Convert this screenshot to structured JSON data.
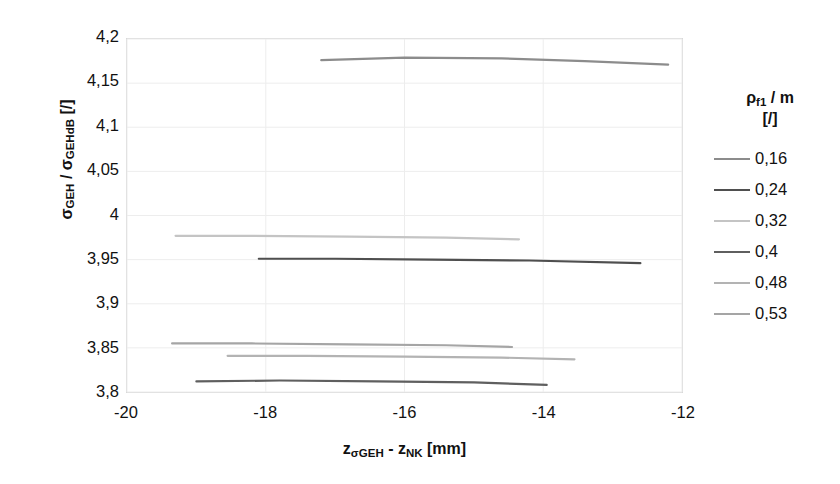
{
  "chart_data": {
    "type": "line",
    "title": "",
    "xlabel": "z_sigmaGEH - z_NK [mm]",
    "ylabel": "sigma_GEH / sigma_GEHdB [/]",
    "xlim": [
      -20,
      -12
    ],
    "ylim": [
      3.8,
      4.2
    ],
    "xticks": [
      "-20",
      "-18",
      "-16",
      "-14",
      "-12"
    ],
    "xtick_values": [
      -20,
      -18,
      -16,
      -14,
      -12
    ],
    "yticks": [
      "4,2",
      "4,15",
      "4,1",
      "4,05",
      "4",
      "3,95",
      "3,9",
      "3,85",
      "3,8"
    ],
    "ytick_values": [
      4.2,
      4.15,
      4.1,
      4.05,
      4.0,
      3.95,
      3.9,
      3.85,
      3.8
    ],
    "grid": true,
    "legend_position": "right",
    "legend_title_line1": "ρf1 / m",
    "legend_title_line2": "[/]",
    "series": [
      {
        "name": "0,16",
        "color": "#8c8c8c",
        "x": [
          -17.2,
          -16.0,
          -14.6,
          -13.4,
          -12.2
        ],
        "y": [
          4.176,
          4.179,
          4.178,
          4.175,
          4.171
        ]
      },
      {
        "name": "0,24",
        "color": "#4f4f4f",
        "x": [
          -18.1,
          -17.0,
          -15.6,
          -14.2,
          -12.6
        ],
        "y": [
          3.951,
          3.951,
          3.95,
          3.949,
          3.946
        ]
      },
      {
        "name": "0,32",
        "color": "#c4c4c4",
        "x": [
          -19.3,
          -18.2,
          -16.8,
          -15.4,
          -14.35
        ],
        "y": [
          3.977,
          3.977,
          3.976,
          3.975,
          3.973
        ]
      },
      {
        "name": "0,4",
        "color": "#5f5f5f",
        "x": [
          -19.0,
          -17.8,
          -16.4,
          -15.0,
          -13.95
        ],
        "y": [
          3.812,
          3.813,
          3.812,
          3.811,
          3.808
        ]
      },
      {
        "name": "0,48",
        "color": "#b3b3b3",
        "x": [
          -18.55,
          -17.4,
          -16.0,
          -14.6,
          -13.55
        ],
        "y": [
          3.841,
          3.841,
          3.84,
          3.839,
          3.837
        ]
      },
      {
        "name": "0,53",
        "color": "#a5a5a5",
        "x": [
          -19.35,
          -18.2,
          -16.8,
          -15.4,
          -14.45
        ],
        "y": [
          3.855,
          3.855,
          3.854,
          3.853,
          3.851
        ]
      }
    ]
  },
  "axis": {
    "y_title_main": "σ",
    "y_title_sub1": "GEH",
    "y_title_mid": " / ",
    "y_title_main2": "σ",
    "y_title_sub2": "GEHdB",
    "y_title_unit": " [/]",
    "x_title_main": "z",
    "x_title_sub1": "σGEH",
    "x_title_mid": " - ",
    "x_title_main2": "z",
    "x_title_sub2": "NK",
    "x_title_unit": " [mm]"
  },
  "legend": {
    "title_rho": "ρ",
    "title_sub": "f1",
    "title_rest": " / m",
    "title_line2": "[/]",
    "items": [
      {
        "label": "0,16",
        "color": "#8c8c8c"
      },
      {
        "label": "0,24",
        "color": "#4f4f4f"
      },
      {
        "label": "0,32",
        "color": "#c4c4c4"
      },
      {
        "label": "0,4",
        "color": "#5f5f5f"
      },
      {
        "label": "0,48",
        "color": "#b3b3b3"
      },
      {
        "label": "0,53",
        "color": "#a5a5a5"
      }
    ]
  }
}
